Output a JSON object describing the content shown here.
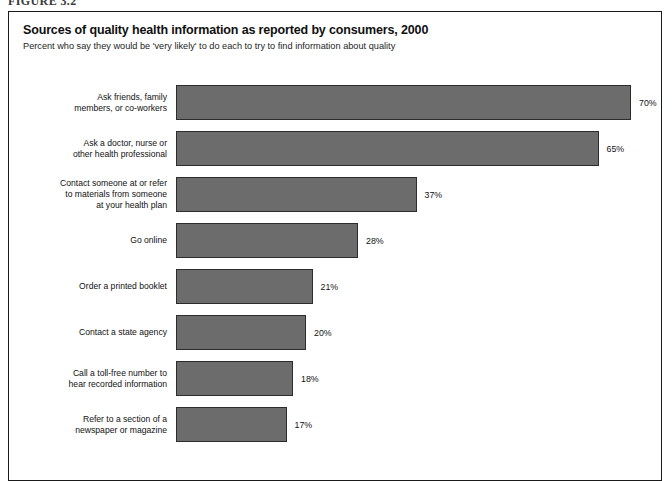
{
  "figure_caption": "FIGURE 3.2",
  "chart_data": {
    "type": "bar",
    "orientation": "horizontal",
    "title": "Sources of quality health information as reported by consumers, 2000",
    "subtitle": "Percent who say they would be 'very likely' to do each to try to find information about quality",
    "xlabel": "",
    "ylabel": "",
    "xlim": [
      0,
      70
    ],
    "grid": false,
    "legend": "none",
    "value_suffix": "%",
    "bar_color": "#6c6c6c",
    "bar_border_color": "#2d2d2d",
    "categories": [
      "Ask friends, family\nmembers, or co-workers",
      "Ask a doctor, nurse or\nother health professional",
      "Contact someone at or refer\nto materials from someone\nat your health plan",
      "Go online",
      "Order a printed booklet",
      "Contact a state agency",
      "Call a toll-free number to\nhear recorded information",
      "Refer to a section of a\nnewspaper or magazine"
    ],
    "values": [
      70,
      65,
      37,
      28,
      21,
      20,
      18,
      17
    ],
    "value_labels": [
      "70%",
      "65%",
      "37%",
      "28%",
      "21%",
      "20%",
      "18%",
      "17%"
    ]
  }
}
